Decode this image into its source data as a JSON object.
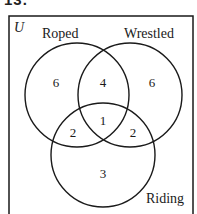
{
  "problem_number": "13.",
  "diagram": {
    "universe_label": "U",
    "sets": [
      {
        "name": "Roped",
        "label": "Roped"
      },
      {
        "name": "Wrestled",
        "label": "Wrestled"
      },
      {
        "name": "Riding",
        "label": "Riding"
      }
    ],
    "regions": {
      "roped_only": "6",
      "wrestled_only": "6",
      "riding_only": "3",
      "roped_wrestled_only": "4",
      "roped_riding_only": "2",
      "wrestled_riding_only": "2",
      "all_three": "1"
    },
    "line_color": "#1a1a1a",
    "background_color": "#ffffff"
  }
}
